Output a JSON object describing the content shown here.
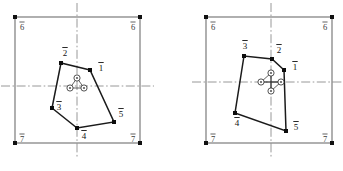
{
  "canvas": {
    "width": 343,
    "height": 171,
    "background": "#ffffff"
  },
  "colors": {
    "frame": "#6f6f6f",
    "centerline": "#8d8d8d",
    "polygon": "#1b1b1b",
    "vertex": "#0d0d0d",
    "label": "#121212",
    "corner_label": "#3b3b3b"
  },
  "figures": [
    {
      "id": "figure-left",
      "name": "left-diagram",
      "frame": {
        "x": 15,
        "y": 17,
        "width": 125,
        "height": 126
      },
      "centerlines": {
        "horizontal_y": 86,
        "vertical_x": 77
      },
      "corner_labels": [
        {
          "name": "corner-top-left",
          "text": "6",
          "overbar": true,
          "x": 22,
          "y": 30
        },
        {
          "name": "corner-top-right",
          "text": "6",
          "overbar": true,
          "x": 133,
          "y": 30
        },
        {
          "name": "corner-bottom-left",
          "text": "7",
          "overbar": true,
          "x": 22,
          "y": 142
        },
        {
          "name": "corner-bottom-right",
          "text": "7",
          "overbar": true,
          "x": 133,
          "y": 142
        }
      ],
      "polygon": {
        "closed": true,
        "vertices": [
          {
            "label": "1",
            "overbar": true,
            "x": 90,
            "y": 70,
            "label_x": 101,
            "label_y": 71
          },
          {
            "label": "2",
            "overbar": true,
            "x": 61,
            "y": 63,
            "label_x": 65,
            "label_y": 56
          },
          {
            "label": "3",
            "overbar": true,
            "x": 52,
            "y": 108,
            "label_x": 59,
            "label_y": 110
          },
          {
            "label": "4",
            "overbar": true,
            "x": 77,
            "y": 128,
            "label_x": 84,
            "label_y": 139
          },
          {
            "label": "5",
            "overbar": true,
            "x": 114,
            "y": 122,
            "label_x": 121,
            "label_y": 117
          }
        ]
      },
      "center_cluster": {
        "type": "triangle",
        "count": 3,
        "nodes": [
          {
            "x": 77,
            "y": 78
          },
          {
            "x": 70,
            "y": 88
          },
          {
            "x": 84,
            "y": 88
          }
        ]
      }
    },
    {
      "id": "figure-right",
      "name": "right-diagram",
      "frame": {
        "x": 35,
        "y": 17,
        "width": 126,
        "height": 126
      },
      "centerlines": {
        "horizontal_y": 82,
        "vertical_x": 100
      },
      "corner_labels": [
        {
          "name": "corner-top-left",
          "text": "6",
          "overbar": true,
          "x": 42,
          "y": 30
        },
        {
          "name": "corner-top-right",
          "text": "6",
          "overbar": true,
          "x": 154,
          "y": 30
        },
        {
          "name": "corner-bottom-left",
          "text": "7",
          "overbar": true,
          "x": 42,
          "y": 142
        },
        {
          "name": "corner-bottom-right",
          "text": "7",
          "overbar": true,
          "x": 154,
          "y": 142
        }
      ],
      "polygon": {
        "closed": true,
        "vertices": [
          {
            "label": "1",
            "overbar": true,
            "x": 113,
            "y": 70,
            "label_x": 124,
            "label_y": 70
          },
          {
            "label": "2",
            "overbar": true,
            "x": 101,
            "y": 59,
            "label_x": 108,
            "label_y": 53
          },
          {
            "label": "3",
            "overbar": true,
            "x": 73,
            "y": 56,
            "label_x": 74,
            "label_y": 49
          },
          {
            "label": "4",
            "overbar": true,
            "x": 64,
            "y": 113,
            "label_x": 66,
            "label_y": 126
          },
          {
            "label": "5",
            "overbar": true,
            "x": 115,
            "y": 131,
            "label_x": 125,
            "label_y": 130
          }
        ]
      },
      "center_cluster": {
        "type": "diamond",
        "count": 4,
        "nodes": [
          {
            "x": 100,
            "y": 73
          },
          {
            "x": 90,
            "y": 82
          },
          {
            "x": 110,
            "y": 82
          },
          {
            "x": 100,
            "y": 91
          }
        ]
      }
    }
  ]
}
